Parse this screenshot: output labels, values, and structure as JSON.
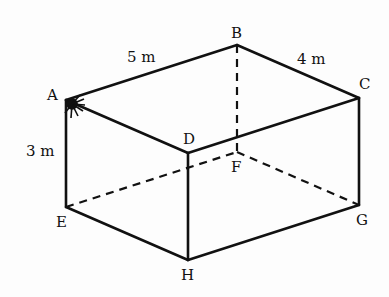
{
  "diagram": {
    "type": "rectangular-prism",
    "vertices": {
      "A": {
        "label": "A",
        "x": 66,
        "y": 100
      },
      "B": {
        "label": "B",
        "x": 237,
        "y": 45
      },
      "C": {
        "label": "C",
        "x": 359,
        "y": 98
      },
      "D": {
        "label": "D",
        "x": 188,
        "y": 153
      },
      "E": {
        "label": "E",
        "x": 66,
        "y": 207
      },
      "F": {
        "label": "F",
        "x": 237,
        "y": 152
      },
      "G": {
        "label": "G",
        "x": 359,
        "y": 205
      },
      "H": {
        "label": "H",
        "x": 188,
        "y": 260
      }
    },
    "dimensions": {
      "length": "5 m",
      "width": "4 m",
      "height": "3 m"
    },
    "edges_solid": [
      "AB",
      "BC",
      "CD",
      "DA",
      "AE",
      "DH",
      "CG",
      "EH",
      "HG"
    ],
    "edges_hidden": [
      "BF",
      "EF",
      "FG"
    ],
    "marker": {
      "at": "A",
      "description": "spider/ant mark at vertex A"
    },
    "colors": {
      "line": "#111111",
      "background": "#fdfdfd"
    }
  }
}
